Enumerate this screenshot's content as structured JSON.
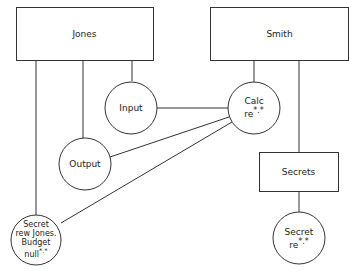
{
  "diagram": {
    "stroke_color": "#333333",
    "background": "#ffffff",
    "nodes": {
      "jones": {
        "shape": "box",
        "label": "Jones"
      },
      "smith": {
        "shape": "box",
        "label": "Smith"
      },
      "secrets_box": {
        "shape": "box",
        "label": "Secrets"
      },
      "input": {
        "shape": "circle",
        "label": "Input"
      },
      "calc": {
        "shape": "circle",
        "line1": "Calc",
        "line2": "re",
        "marks": "*.*"
      },
      "output": {
        "shape": "circle",
        "label": "Output"
      },
      "secret_left": {
        "shape": "circle",
        "line1": "Secret",
        "line2": "rew Jones.",
        "line3": "Budget",
        "line4": "null",
        "marks": "*.*"
      },
      "secret_right": {
        "shape": "circle",
        "line1": "Secret",
        "line2": "re",
        "marks": "*.*"
      }
    },
    "edges": [
      [
        "jones",
        "secret_left"
      ],
      [
        "jones",
        "output"
      ],
      [
        "jones",
        "input"
      ],
      [
        "input",
        "calc"
      ],
      [
        "output",
        "calc"
      ],
      [
        "secret_left",
        "calc"
      ],
      [
        "smith",
        "calc"
      ],
      [
        "smith",
        "secrets_box"
      ],
      [
        "secrets_box",
        "secret_right"
      ]
    ]
  }
}
